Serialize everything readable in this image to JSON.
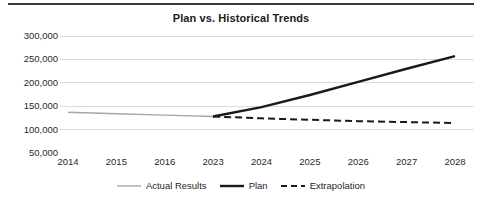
{
  "chart_data": {
    "type": "line",
    "title": "Plan vs. Historical Trends",
    "xlabel": "",
    "ylabel": "",
    "x": [
      "2014",
      "2015",
      "2016",
      "2023",
      "2024",
      "2025",
      "2026",
      "2027",
      "2028"
    ],
    "categories": [
      "2014",
      "2015",
      "2016",
      "2023",
      "2024",
      "2025",
      "2026",
      "2027",
      "2028"
    ],
    "ylim": [
      50000,
      300000
    ],
    "yticks": [
      50000,
      100000,
      150000,
      200000,
      250000,
      300000
    ],
    "ytick_labels": [
      "50,000",
      "100,000",
      "150,000",
      "200,000",
      "250,000",
      "300,000"
    ],
    "grid": true,
    "grid_axis": "y",
    "legend_position": "bottom",
    "series": [
      {
        "name": "Actual Results",
        "color": "#a6a6a6",
        "style": "solid",
        "width": 1.4,
        "x": [
          "2014",
          "2015",
          "2016",
          "2023"
        ],
        "values": [
          137000,
          134000,
          131000,
          128000
        ]
      },
      {
        "name": "Plan",
        "color": "#1a1a1a",
        "style": "solid",
        "width": 2.4,
        "x": [
          "2023",
          "2024",
          "2025",
          "2026",
          "2027",
          "2028"
        ],
        "values": [
          128000,
          148000,
          174000,
          202000,
          230000,
          257000
        ]
      },
      {
        "name": "Extrapolation",
        "color": "#1a1a1a",
        "style": "dashed",
        "width": 2.0,
        "x": [
          "2023",
          "2024",
          "2025",
          "2026",
          "2027",
          "2028"
        ],
        "values": [
          128000,
          124000,
          121000,
          118000,
          116000,
          114000
        ]
      }
    ]
  },
  "legend": {
    "items": [
      {
        "label": "Actual Results"
      },
      {
        "label": "Plan"
      },
      {
        "label": "Extrapolation"
      }
    ]
  }
}
